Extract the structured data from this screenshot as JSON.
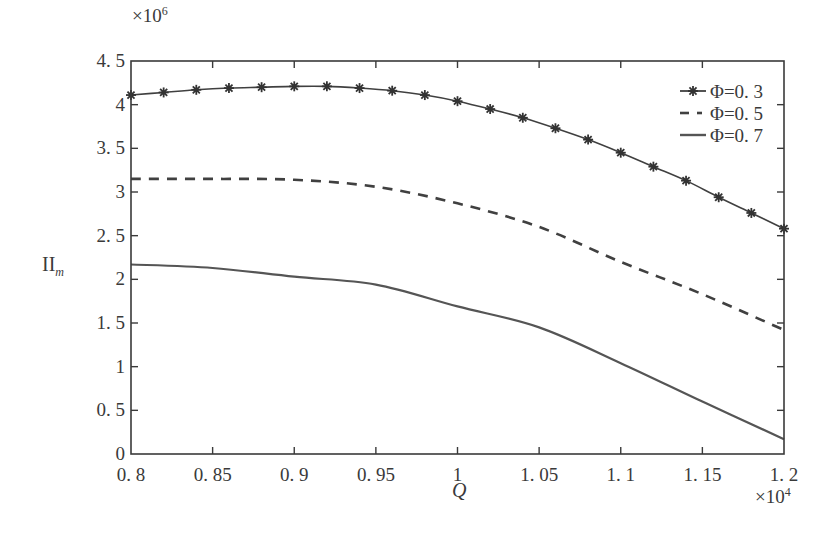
{
  "chart_data": {
    "type": "line",
    "title": "",
    "xlabel": "Q",
    "ylabel": "II_m",
    "ylabel_main": "II",
    "ylabel_sub": "m",
    "x_multiplier": "×10",
    "x_multiplier_exp": "4",
    "y_multiplier": "×10",
    "y_multiplier_exp": "6",
    "xlim": [
      0.8,
      1.2
    ],
    "ylim": [
      0,
      4.5
    ],
    "grid": false,
    "legend_position": "upper right",
    "x_ticks": [
      0.8,
      0.85,
      0.9,
      0.95,
      1.0,
      1.05,
      1.1,
      1.15,
      1.2
    ],
    "x_tick_labels": [
      "0. 8",
      "0. 85",
      "0. 9",
      "0. 95",
      "1",
      "1. 05",
      "1. 1",
      "1. 15",
      "1. 2"
    ],
    "y_ticks": [
      0,
      0.5,
      1,
      1.5,
      2,
      2.5,
      3,
      3.5,
      4,
      4.5
    ],
    "y_tick_labels": [
      "0",
      "0. 5",
      "1",
      "1. 5",
      "2",
      "2. 5",
      "3",
      "3. 5",
      "4",
      "4. 5"
    ],
    "series": [
      {
        "name": "Φ=0.3",
        "legend_label": "Φ=0. 3",
        "style": "solid-star",
        "color": "#404040",
        "x": [
          0.8,
          0.82,
          0.84,
          0.86,
          0.88,
          0.9,
          0.92,
          0.94,
          0.96,
          0.98,
          1.0,
          1.02,
          1.04,
          1.06,
          1.08,
          1.1,
          1.12,
          1.14,
          1.16,
          1.18,
          1.2
        ],
        "values": [
          4.11,
          4.14,
          4.17,
          4.19,
          4.2,
          4.21,
          4.21,
          4.19,
          4.16,
          4.11,
          4.04,
          3.95,
          3.85,
          3.73,
          3.6,
          3.45,
          3.29,
          3.13,
          2.94,
          2.76,
          2.58
        ]
      },
      {
        "name": "Φ=0.5",
        "legend_label": "Φ=0. 5",
        "style": "dashed",
        "color": "#404040",
        "x": [
          0.8,
          0.85,
          0.9,
          0.95,
          1.0,
          1.05,
          1.1,
          1.15,
          1.2
        ],
        "values": [
          3.15,
          3.15,
          3.14,
          3.06,
          2.87,
          2.6,
          2.2,
          1.83,
          1.42
        ]
      },
      {
        "name": "Φ=0.7",
        "legend_label": "Φ=0. 7",
        "style": "solid",
        "color": "#555555",
        "x": [
          0.8,
          0.85,
          0.9,
          0.95,
          1.0,
          1.05,
          1.1,
          1.15,
          1.2
        ],
        "values": [
          2.17,
          2.13,
          2.03,
          1.94,
          1.69,
          1.45,
          1.04,
          0.6,
          0.17
        ]
      }
    ]
  }
}
